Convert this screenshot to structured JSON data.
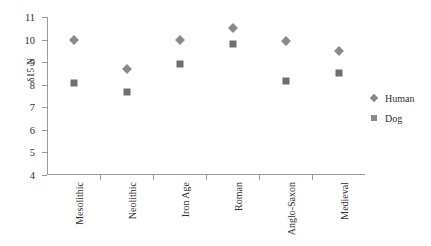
{
  "chart_data": {
    "type": "scatter",
    "title": "",
    "xlabel": "",
    "ylabel": "δ15 N",
    "ylim": [
      4,
      11
    ],
    "yticks": [
      4,
      5,
      6,
      7,
      8,
      9,
      10,
      11
    ],
    "grid": false,
    "legend_position": "right",
    "categories": [
      "Mesolithic",
      "Neolithic",
      "Iron Age",
      "Roman",
      "Anglo-Saxon",
      "Medieval"
    ],
    "series": [
      {
        "name": "Human",
        "marker": "diamond",
        "color": "#8a8a8a",
        "values": [
          10.0,
          8.7,
          10.0,
          10.5,
          9.95,
          9.5
        ]
      },
      {
        "name": "Dog",
        "marker": "square",
        "color": "#6f6f6f",
        "values": [
          8.1,
          7.7,
          8.9,
          9.8,
          8.15,
          8.5
        ]
      }
    ]
  },
  "legend": {
    "entries": [
      {
        "label": "Human"
      },
      {
        "label": "Dog"
      }
    ]
  }
}
